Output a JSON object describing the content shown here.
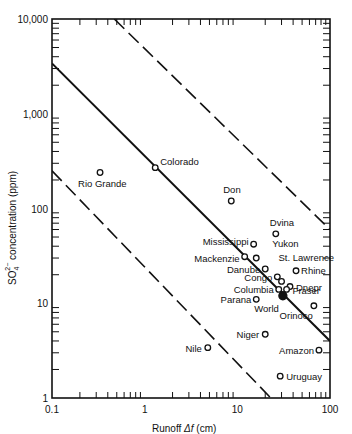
{
  "chart_data": {
    "type": "scatter",
    "title": "",
    "xlabel": "Runoff  Δf (cm)",
    "ylabel": "SO4 2− concentration (ppm)",
    "xscale": "log",
    "yscale": "log",
    "xlim": [
      0.1,
      100
    ],
    "ylim": [
      1,
      10000
    ],
    "x_ticks": [
      "0.1",
      "1",
      "10",
      "100"
    ],
    "y_ticks": [
      "1",
      "10",
      "100",
      "1,000",
      "10,000"
    ],
    "grid": false,
    "legend": null,
    "points": [
      {
        "label": "Rio Grande",
        "x": 0.33,
        "y": 240
      },
      {
        "label": "Colorado",
        "x": 1.3,
        "y": 270
      },
      {
        "label": "Don",
        "x": 8.6,
        "y": 120
      },
      {
        "label": "Dvina",
        "x": 26,
        "y": 54
      },
      {
        "label": "Mississippi",
        "x": 15,
        "y": 42
      },
      {
        "label": "Yukon",
        "x": 16,
        "y": 30
      },
      {
        "label": "Mackenzie",
        "x": 12,
        "y": 31
      },
      {
        "label": "Danube",
        "x": 20,
        "y": 23
      },
      {
        "label": "Rhine",
        "x": 43,
        "y": 22
      },
      {
        "label": "Congo",
        "x": 27,
        "y": 19
      },
      {
        "label": "St. Lawrence",
        "x": 30,
        "y": 17
      },
      {
        "label": "Dnepr",
        "x": 37,
        "y": 15
      },
      {
        "label": "Columbia",
        "x": 28,
        "y": 14
      },
      {
        "label": "Fraser",
        "x": 34,
        "y": 14
      },
      {
        "label": "World",
        "x": 31,
        "y": 12,
        "filled": true
      },
      {
        "label": "Parana",
        "x": 16,
        "y": 11
      },
      {
        "label": "Orinoco",
        "x": 67,
        "y": 9.4
      },
      {
        "label": "Niger",
        "x": 20,
        "y": 4.7
      },
      {
        "label": "Nile",
        "x": 4.8,
        "y": 3.4
      },
      {
        "label": "Amazon",
        "x": 76,
        "y": 3.2
      },
      {
        "label": "Uruguay",
        "x": 29,
        "y": 1.7
      }
    ],
    "reference_lines": [
      {
        "style": "solid",
        "from": [
          0.1,
          3400
        ],
        "to": [
          100,
          4
        ]
      },
      {
        "style": "dashed",
        "from": [
          0.47,
          10000
        ],
        "to": [
          100,
          60
        ]
      },
      {
        "style": "dashed",
        "from": [
          0.1,
          250
        ],
        "to": [
          23,
          1
        ]
      }
    ]
  },
  "labels": {
    "x_title": "Runoff",
    "x_title_var": "Δf",
    "x_title_unit": "(cm)",
    "y_title_main": "SO",
    "y_title_rest": " concentration (ppm)"
  }
}
